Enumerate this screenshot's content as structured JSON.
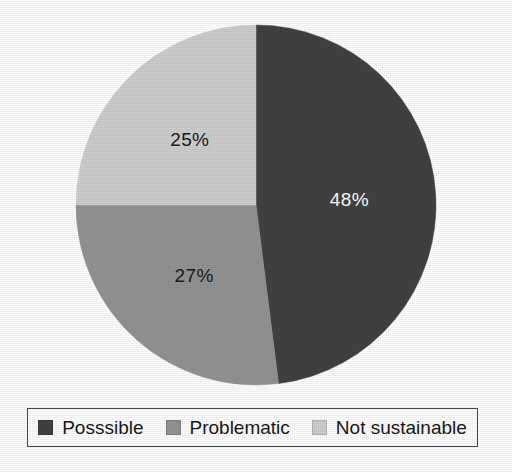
{
  "chart_data": {
    "type": "pie",
    "title": "",
    "categories": [
      "Posssible",
      "Problematic",
      "Not sustainable"
    ],
    "values": [
      48,
      27,
      25
    ],
    "value_labels": [
      "48%",
      "27%",
      "25%"
    ],
    "units": "percent",
    "colors": [
      "#424242",
      "#949494",
      "#cfcfcf"
    ],
    "label_text_colors": [
      "#ffffff",
      "#1a1a1a",
      "#1a1a1a"
    ],
    "start_angle_deg": 0,
    "direction": "clockwise",
    "legend_position": "bottom",
    "grid": false,
    "xlabel": "",
    "ylabel": "",
    "slices": [
      {
        "label": "Posssible",
        "value": 48,
        "display": "48%",
        "color": "#424242"
      },
      {
        "label": "Problematic",
        "value": 27,
        "display": "27%",
        "color": "#949494"
      },
      {
        "label": "Not sustainable",
        "value": 25,
        "display": "25%",
        "color": "#cfcfcf"
      }
    ]
  },
  "legend": {
    "items": [
      {
        "label": "Posssible",
        "color": "#424242"
      },
      {
        "label": "Problematic",
        "color": "#949494"
      },
      {
        "label": "Not sustainable",
        "color": "#cfcfcf"
      }
    ]
  }
}
